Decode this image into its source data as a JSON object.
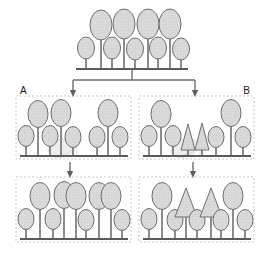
{
  "figure": {
    "type": "schematic-diagram",
    "title": "",
    "width": 256,
    "height": 254,
    "background": "#ffffff",
    "colors": {
      "shape_fill": "#d8d8d8",
      "shape_stroke": "#6e6e6e",
      "stem": "#707070",
      "baseline": "#5a5a5a",
      "panel_border": "#c9c9c9",
      "connector": "#6e6e6e",
      "ghost_fill": "#ededed",
      "ghost_stroke": "#dcdcdc",
      "label_text": "#1a1a1a"
    },
    "labels": {
      "branch_a": "A",
      "branch_b": "B"
    },
    "panels": [
      {
        "id": "source-population",
        "name": "top-source-panel",
        "bordered": false,
        "baseline_y": 69,
        "baseline_x1": 76,
        "baseline_x2": 188,
        "shapes": [
          {
            "kind": "ellipse",
            "size": "small",
            "cx": 86,
            "cy": 48,
            "rx": 8.5,
            "ry": 11,
            "stem_to": 69
          },
          {
            "kind": "ellipse",
            "size": "large",
            "cx": 101,
            "cy": 25,
            "rx": 11,
            "ry": 15,
            "stem_to": 69
          },
          {
            "kind": "ellipse",
            "size": "small",
            "cx": 112,
            "cy": 48,
            "rx": 8.5,
            "ry": 11,
            "stem_to": 69
          },
          {
            "kind": "ellipse",
            "size": "large",
            "cx": 124,
            "cy": 24,
            "rx": 11,
            "ry": 15,
            "stem_to": 69
          },
          {
            "kind": "ellipse",
            "size": "small",
            "cx": 135,
            "cy": 49,
            "rx": 8.5,
            "ry": 11,
            "stem_to": 69
          },
          {
            "kind": "ellipse",
            "size": "large",
            "cx": 148,
            "cy": 24,
            "rx": 11,
            "ry": 15,
            "stem_to": 69
          },
          {
            "kind": "ellipse",
            "size": "small",
            "cx": 158,
            "cy": 48,
            "rx": 8.5,
            "ry": 11,
            "stem_to": 69
          },
          {
            "kind": "ellipse",
            "size": "large",
            "cx": 170,
            "cy": 24,
            "rx": 11,
            "ry": 15,
            "stem_to": 69
          },
          {
            "kind": "ellipse",
            "size": "small",
            "cx": 181,
            "cy": 49,
            "rx": 8.5,
            "ry": 11,
            "stem_to": 69
          }
        ]
      },
      {
        "id": "branch-a-step1",
        "name": "panel-a-upper",
        "bordered": true,
        "box": {
          "x": 16,
          "y": 96,
          "w": 115,
          "h": 63
        },
        "baseline_y": 156,
        "baseline_x1": 20,
        "baseline_x2": 128,
        "ghost": {
          "cx": 62,
          "cy": 148,
          "rx": 14,
          "ry": 9,
          "bracket": true
        },
        "shapes": [
          {
            "kind": "ellipse",
            "size": "small",
            "cx": 26,
            "cy": 136,
            "rx": 8,
            "ry": 10.5,
            "stem_to": 156
          },
          {
            "kind": "ellipse",
            "size": "large",
            "cx": 38,
            "cy": 114,
            "rx": 10,
            "ry": 13.5,
            "stem_to": 156
          },
          {
            "kind": "ellipse",
            "size": "small",
            "cx": 50,
            "cy": 136,
            "rx": 8,
            "ry": 10.5,
            "stem_to": 156
          },
          {
            "kind": "ellipse",
            "size": "large",
            "cx": 61,
            "cy": 113,
            "rx": 10,
            "ry": 13.5,
            "stem_to": 156
          },
          {
            "kind": "ellipse",
            "size": "small",
            "cx": 73,
            "cy": 137,
            "rx": 8,
            "ry": 10.5,
            "stem_to": 156
          },
          {
            "kind": "ellipse",
            "size": "small",
            "cx": 97,
            "cy": 137,
            "rx": 8,
            "ry": 10.5,
            "stem_to": 156
          },
          {
            "kind": "ellipse",
            "size": "large",
            "cx": 108,
            "cy": 113,
            "rx": 10,
            "ry": 13.5,
            "stem_to": 156
          },
          {
            "kind": "ellipse",
            "size": "small",
            "cx": 120,
            "cy": 137,
            "rx": 8,
            "ry": 10.5,
            "stem_to": 156
          }
        ]
      },
      {
        "id": "branch-b-step1",
        "name": "panel-b-upper",
        "bordered": true,
        "box": {
          "x": 139,
          "y": 96,
          "w": 115,
          "h": 63
        },
        "baseline_y": 156,
        "baseline_x1": 143,
        "baseline_x2": 251,
        "ghost": {
          "cx": 185,
          "cy": 148,
          "rx": 14,
          "ry": 9,
          "bracket": true
        },
        "shapes": [
          {
            "kind": "ellipse",
            "size": "small",
            "cx": 149,
            "cy": 136,
            "rx": 8,
            "ry": 10.5,
            "stem_to": 156
          },
          {
            "kind": "ellipse",
            "size": "large",
            "cx": 161,
            "cy": 114,
            "rx": 10,
            "ry": 13.5,
            "stem_to": 156
          },
          {
            "kind": "ellipse",
            "size": "small",
            "cx": 173,
            "cy": 136,
            "rx": 8,
            "ry": 10.5,
            "stem_to": 156
          },
          {
            "kind": "triangle",
            "size": "small",
            "cx": 188,
            "apex_y": 124,
            "half_w": 7,
            "base_y": 150,
            "stem_to": 156
          },
          {
            "kind": "triangle",
            "size": "small",
            "cx": 202,
            "apex_y": 123,
            "half_w": 7,
            "base_y": 150,
            "stem_to": 156
          },
          {
            "kind": "ellipse",
            "size": "small",
            "cx": 216,
            "cy": 137,
            "rx": 8,
            "ry": 10.5,
            "stem_to": 156
          },
          {
            "kind": "ellipse",
            "size": "large",
            "cx": 231,
            "cy": 113,
            "rx": 10,
            "ry": 13.5,
            "stem_to": 156
          },
          {
            "kind": "ellipse",
            "size": "small",
            "cx": 243,
            "cy": 137,
            "rx": 8,
            "ry": 10.5,
            "stem_to": 156
          }
        ]
      },
      {
        "id": "branch-a-step2",
        "name": "panel-a-lower",
        "bordered": true,
        "box": {
          "x": 16,
          "y": 177,
          "w": 115,
          "h": 65
        },
        "baseline_y": 239,
        "baseline_x1": 20,
        "baseline_x2": 128,
        "shapes": [
          {
            "kind": "ellipse",
            "size": "small",
            "cx": 26,
            "cy": 219,
            "rx": 8,
            "ry": 10.5,
            "stem_to": 239
          },
          {
            "kind": "ellipse",
            "size": "large",
            "cx": 40,
            "cy": 196,
            "rx": 10,
            "ry": 13.5,
            "stem_to": 239
          },
          {
            "kind": "ellipse",
            "size": "small",
            "cx": 53,
            "cy": 219,
            "rx": 8,
            "ry": 10.5,
            "stem_to": 239
          },
          {
            "kind": "ellipse",
            "size": "large",
            "cx": 64,
            "cy": 195,
            "rx": 10,
            "ry": 13.5,
            "stem_to": 239
          },
          {
            "kind": "ellipse",
            "size": "large",
            "cx": 76,
            "cy": 196,
            "rx": 10,
            "ry": 13.5,
            "stem_to": 239
          },
          {
            "kind": "ellipse",
            "size": "small",
            "cx": 86,
            "cy": 220,
            "rx": 8,
            "ry": 10.5,
            "stem_to": 239
          },
          {
            "kind": "ellipse",
            "size": "large",
            "cx": 99,
            "cy": 196,
            "rx": 10,
            "ry": 13.5,
            "stem_to": 239
          },
          {
            "kind": "ellipse",
            "size": "large",
            "cx": 111,
            "cy": 196,
            "rx": 10,
            "ry": 13.5,
            "stem_to": 239
          },
          {
            "kind": "ellipse",
            "size": "small",
            "cx": 122,
            "cy": 220,
            "rx": 8,
            "ry": 10.5,
            "stem_to": 239
          }
        ]
      },
      {
        "id": "branch-b-step2",
        "name": "panel-b-lower",
        "bordered": true,
        "box": {
          "x": 139,
          "y": 177,
          "w": 115,
          "h": 65
        },
        "baseline_y": 239,
        "baseline_x1": 143,
        "baseline_x2": 251,
        "shapes": [
          {
            "kind": "ellipse",
            "size": "small",
            "cx": 149,
            "cy": 219,
            "rx": 8,
            "ry": 10.5,
            "stem_to": 239
          },
          {
            "kind": "ellipse",
            "size": "large",
            "cx": 162,
            "cy": 196,
            "rx": 10,
            "ry": 13.5,
            "stem_to": 239
          },
          {
            "kind": "ellipse",
            "size": "small",
            "cx": 175,
            "cy": 220,
            "rx": 8,
            "ry": 10.5,
            "stem_to": 239
          },
          {
            "kind": "triangle",
            "size": "large",
            "cx": 186,
            "apex_y": 188,
            "half_w": 11,
            "base_y": 217,
            "stem_to": 239
          },
          {
            "kind": "ellipse",
            "size": "small",
            "cx": 197,
            "cy": 220,
            "rx": 8,
            "ry": 10.5,
            "stem_to": 239
          },
          {
            "kind": "triangle",
            "size": "large",
            "cx": 211,
            "apex_y": 188,
            "half_w": 11,
            "base_y": 217,
            "stem_to": 239
          },
          {
            "kind": "ellipse",
            "size": "small",
            "cx": 221,
            "cy": 220,
            "rx": 8,
            "ry": 10.5,
            "stem_to": 239
          },
          {
            "kind": "ellipse",
            "size": "large",
            "cx": 233,
            "cy": 196,
            "rx": 10,
            "ry": 13.5,
            "stem_to": 239
          },
          {
            "kind": "ellipse",
            "size": "small",
            "cx": 245,
            "cy": 220,
            "rx": 8,
            "ry": 10.5,
            "stem_to": 239
          }
        ]
      }
    ],
    "connectors": [
      {
        "name": "trunk-from-source",
        "kind": "line",
        "x1": 132,
        "y1": 69,
        "x2": 132,
        "y2": 80
      },
      {
        "name": "split-bar",
        "kind": "line",
        "x1": 73,
        "y1": 80,
        "x2": 195,
        "y2": 80
      },
      {
        "name": "branch-a-arrow",
        "kind": "arrow",
        "x1": 73,
        "y1": 80,
        "x2": 73,
        "y2": 94
      },
      {
        "name": "branch-b-arrow",
        "kind": "arrow",
        "x1": 195,
        "y1": 80,
        "x2": 195,
        "y2": 94
      },
      {
        "name": "panel-a-step-arrow",
        "kind": "arrow",
        "x1": 70,
        "y1": 162,
        "x2": 70,
        "y2": 175
      },
      {
        "name": "panel-b-step-arrow",
        "kind": "arrow",
        "x1": 193,
        "y1": 162,
        "x2": 193,
        "y2": 175
      }
    ]
  }
}
